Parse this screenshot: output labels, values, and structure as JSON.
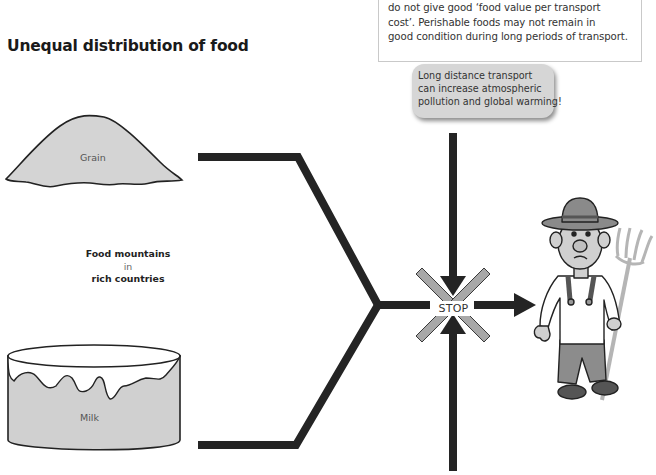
{
  "info_box": {
    "lines": [
      "do not give good ‘food value per transport",
      "cost’. Perishable foods may not remain in",
      "good condition during long periods of transport."
    ]
  },
  "title": "Unequal distribution of food",
  "callout": {
    "lines": [
      "Long distance transport",
      "can increase atmospheric",
      "pollution and global warming!"
    ]
  },
  "grain_pile": {
    "label": "Grain"
  },
  "milk_tank": {
    "label": "Milk"
  },
  "food_mountains_label": {
    "line1": "Food mountains",
    "line2": "in",
    "line3": "rich countries"
  },
  "stop_sign": {
    "label": "STOP"
  },
  "icons": {
    "farmer": "farmer-illustration",
    "arrow": "arrow-icon",
    "stop_cross": "cross-icon"
  },
  "colors": {
    "path_stroke": "#222222",
    "cross_gray": "#a8a8a8",
    "fill_gray": "#d4d4d4",
    "bubble_gray": "#d6d6d6"
  }
}
